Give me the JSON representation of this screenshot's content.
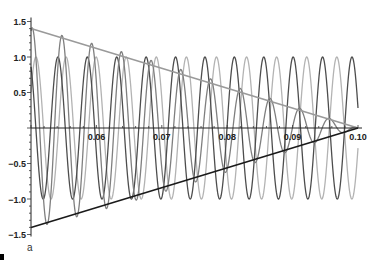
{
  "chart_data": {
    "type": "line",
    "title": "",
    "xlabel": "",
    "ylabel": "",
    "panel_label": "a",
    "xlim": [
      0.05,
      0.1
    ],
    "ylim": [
      -1.5,
      1.5
    ],
    "grid": false,
    "legend": null,
    "x_ticks": [
      0.06,
      0.07,
      0.08,
      0.09,
      0.1
    ],
    "x_tick_labels": [
      "0.06",
      "0.07",
      "0.08",
      "0.09",
      "0.10"
    ],
    "y_ticks": [
      1.5,
      1.0,
      0.5,
      -0.5,
      -1.0,
      -1.5
    ],
    "y_tick_labels": [
      "1.5",
      "1.0",
      "0.5",
      "−0.5",
      "−1.0",
      "−1.5"
    ],
    "series": [
      {
        "name": "wave 1",
        "kind": "cosine",
        "amplitude": 1.0,
        "frequency": 222.4,
        "peak_at": 0.09908,
        "color": "#4d4d4d"
      },
      {
        "name": "wave 2",
        "kind": "cosine",
        "amplitude": 1.0,
        "frequency": 217.4,
        "peak_at": 0.09676,
        "color": "#b3b3b3"
      },
      {
        "name": "sum (wave 1 + wave 2)",
        "kind": "sum",
        "of": [
          0,
          1
        ],
        "color": "#7f7f7f"
      }
    ],
    "envelope_lines": [
      {
        "name": "upper envelope",
        "x": [
          0.05,
          0.1
        ],
        "y": [
          1.4,
          0.0
        ],
        "color": "#9a9a9a"
      },
      {
        "name": "lower envelope",
        "x": [
          0.05,
          0.1
        ],
        "y": [
          -1.4,
          0.0
        ],
        "color": "#1a1a1a"
      }
    ]
  }
}
